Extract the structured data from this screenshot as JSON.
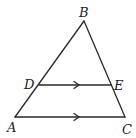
{
  "diagram": {
    "type": "triangle-with-parallel-segment",
    "stroke_color": "#2a2a2a",
    "background": "#ffffff",
    "points": {
      "A": {
        "label": "A",
        "x": 15,
        "y": 117
      },
      "B": {
        "label": "B",
        "x": 84,
        "y": 21
      },
      "C": {
        "label": "C",
        "x": 125,
        "y": 117
      },
      "D": {
        "label": "D",
        "x": 39,
        "y": 85
      },
      "E": {
        "label": "E",
        "x": 111,
        "y": 85
      }
    },
    "segments": [
      "AB",
      "BC",
      "AC",
      "DE"
    ],
    "parallel_marks": [
      "DE",
      "AC"
    ]
  }
}
